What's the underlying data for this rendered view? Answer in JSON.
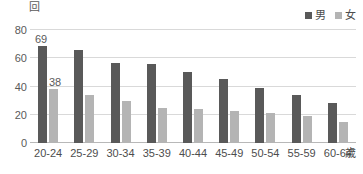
{
  "chart_data": {
    "type": "bar",
    "title": "",
    "xlabel": "歳",
    "ylabel": "回",
    "ylim": [
      0,
      80
    ],
    "yticks": [
      0,
      20,
      40,
      60,
      80
    ],
    "grid": true,
    "legend_position": "top-right",
    "categories": [
      "20-24",
      "25-29",
      "30-34",
      "35-39",
      "40-44",
      "45-49",
      "50-54",
      "55-59",
      "60-64"
    ],
    "series": [
      {
        "name": "男",
        "color": "#595959",
        "values": [
          69,
          66,
          57,
          56,
          50,
          45,
          39,
          34,
          28
        ]
      },
      {
        "name": "女",
        "color": "#b4b4b4",
        "values": [
          38,
          34,
          30,
          25,
          24,
          23,
          21,
          19,
          15
        ]
      }
    ],
    "annotations": [
      {
        "text": "69",
        "series": "男",
        "category": "20-24"
      },
      {
        "text": "38",
        "series": "女",
        "category": "20-24"
      }
    ]
  },
  "axes": {
    "y_unit_label": "回",
    "x_unit_label": "歳",
    "y_tick_labels": [
      "80",
      "60",
      "40",
      "20",
      "0"
    ]
  },
  "legend": {
    "items": [
      {
        "label": "男",
        "color": "#595959"
      },
      {
        "label": "女",
        "color": "#b4b4b4"
      }
    ]
  }
}
